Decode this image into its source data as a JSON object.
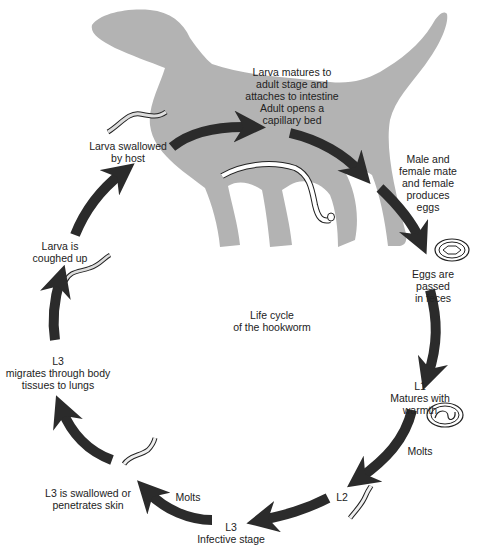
{
  "title": "Life cycle\nof the hookworm",
  "colors": {
    "dog_silhouette": "#b3b3b3",
    "arrow": "#2b2b2b",
    "text": "#222222",
    "background": "#ffffff"
  },
  "stages": [
    {
      "id": "larva-matures",
      "text": "Larva matures to\nadult stage and\nattaches to intestine\nAdult opens a\ncapillary bed"
    },
    {
      "id": "mate-eggs",
      "text": "Male and female mate\nand female produces eggs"
    },
    {
      "id": "eggs-passed",
      "text": "Eggs are passed\nin feces"
    },
    {
      "id": "l1",
      "text": "L1\nMatures with warmth"
    },
    {
      "id": "molts-1",
      "text": "Molts"
    },
    {
      "id": "l2",
      "text": "L2"
    },
    {
      "id": "l3-infective",
      "text": "L3\nInfective stage"
    },
    {
      "id": "molts-2",
      "text": "Molts"
    },
    {
      "id": "l3-swallowed",
      "text": "L3 is swallowed or\npenetrates skin"
    },
    {
      "id": "l3-migrates",
      "text": "L3\nmigrates through body\ntissues to lungs"
    },
    {
      "id": "larva-coughed",
      "text": "Larva is\ncoughed up"
    },
    {
      "id": "larva-swallowed",
      "text": "Larva swallowed\nby host"
    }
  ],
  "icons": [
    "dog-silhouette-icon",
    "adult-hookworm-icon",
    "egg-icon",
    "embryonated-egg-icon",
    "larva-icon"
  ]
}
